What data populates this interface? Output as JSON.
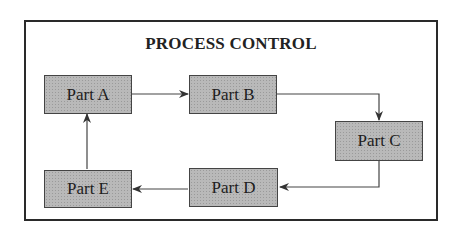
{
  "diagram": {
    "title": "PROCESS CONTROL",
    "nodes": [
      {
        "id": "A",
        "label": "Part A"
      },
      {
        "id": "B",
        "label": "Part B"
      },
      {
        "id": "C",
        "label": "Part C"
      },
      {
        "id": "D",
        "label": "Part D"
      },
      {
        "id": "E",
        "label": "Part E"
      }
    ],
    "edges": [
      {
        "from": "A",
        "to": "B"
      },
      {
        "from": "B",
        "to": "C"
      },
      {
        "from": "C",
        "to": "D"
      },
      {
        "from": "D",
        "to": "E"
      },
      {
        "from": "E",
        "to": "A"
      }
    ],
    "colors": {
      "box_fill": "#b9b9b9",
      "line": "#333333",
      "background": "#ffffff"
    }
  }
}
